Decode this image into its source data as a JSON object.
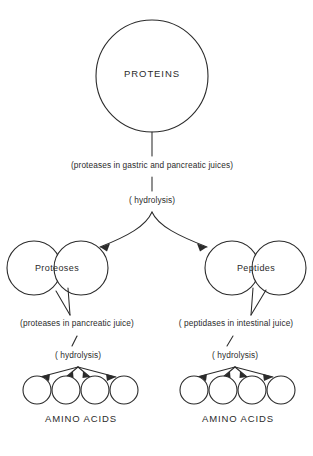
{
  "diagram": {
    "background_color": "#ffffff",
    "ink_color": "#2b2b2b",
    "nodes": {
      "proteins": "PROTEINS",
      "proteoses": "Proteoses",
      "peptides": "Peptides",
      "amino_acids_left": "AMINO ACIDS",
      "amino_acids_right": "AMINO ACIDS"
    },
    "annotations": {
      "enzymes_top": "(proteases in gastric and pancreatic juices)",
      "hydrolysis_top": "( hydrolysis)",
      "enzymes_left": "(proteases in pancreatic juice)",
      "hydrolysis_left": "( hydrolysis)",
      "enzymes_right": "( peptidases in intestinal juice)",
      "hydrolysis_right": "( hydrolysis)"
    },
    "amino_acid_units": {
      "left_count": 4,
      "right_count": 4
    }
  }
}
